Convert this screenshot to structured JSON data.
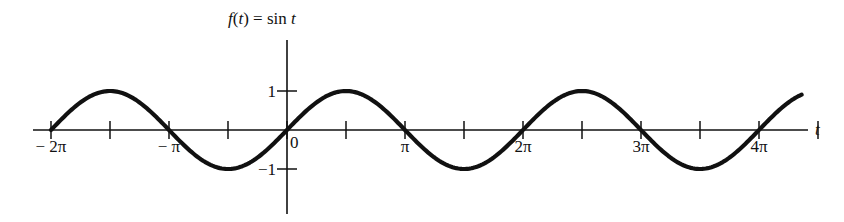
{
  "chart_data": {
    "type": "line",
    "title": "f(t) = sin t",
    "title_parts": {
      "f": "f",
      "open": "(",
      "t": "t",
      "close": ") = sin ",
      "t2": "t"
    },
    "xlabel": "t",
    "ylabel": "",
    "function": "sin(t)",
    "xlim": [
      -6.6,
      14.6
    ],
    "ylim": [
      -1,
      1
    ],
    "x_ticks": [
      {
        "value": -6.2832,
        "label": "− 2π"
      },
      {
        "value": -4.7124,
        "label": ""
      },
      {
        "value": -3.1416,
        "label": "− π"
      },
      {
        "value": -1.5708,
        "label": ""
      },
      {
        "value": 0,
        "label": "0"
      },
      {
        "value": 1.5708,
        "label": ""
      },
      {
        "value": 3.1416,
        "label": "π"
      },
      {
        "value": 4.7124,
        "label": ""
      },
      {
        "value": 6.2832,
        "label": "2π"
      },
      {
        "value": 7.854,
        "label": ""
      },
      {
        "value": 9.4248,
        "label": "3π"
      },
      {
        "value": 10.9956,
        "label": ""
      },
      {
        "value": 12.5664,
        "label": "4π"
      },
      {
        "value": 14.1372,
        "label": ""
      }
    ],
    "y_ticks": [
      {
        "value": 1,
        "label": "1"
      },
      {
        "value": -1,
        "label": "−1"
      }
    ],
    "x_range_plotted": [
      -6.2832,
      13.7
    ],
    "grid": false,
    "legend": null
  }
}
